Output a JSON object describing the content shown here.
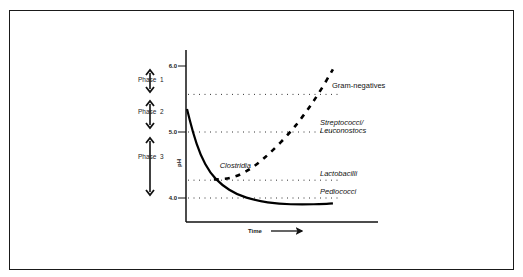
{
  "chart_data": {
    "type": "line",
    "title": "",
    "xlabel": "Time",
    "ylabel": "pH",
    "ylim": [
      3.8,
      6.2
    ],
    "xlim": [
      0,
      10
    ],
    "yticks": [
      {
        "value": 6.0,
        "label": "6.0"
      },
      {
        "value": 5.0,
        "label": "5.0"
      },
      {
        "value": 4.0,
        "label": "4.0"
      }
    ],
    "grid": false,
    "series": [
      {
        "name": "pH",
        "style": "solid",
        "points": [
          [
            0,
            5.35
          ],
          [
            0.3,
            5.0
          ],
          [
            0.7,
            4.65
          ],
          [
            1.2,
            4.38
          ],
          [
            1.8,
            4.2
          ],
          [
            2.6,
            4.05
          ],
          [
            3.6,
            3.96
          ],
          [
            4.8,
            3.91
          ],
          [
            6.0,
            3.9
          ],
          [
            7.2,
            3.91
          ],
          [
            7.6,
            3.92
          ]
        ]
      },
      {
        "name": "Bacterial growth (dashed)",
        "style": "dashed",
        "points": [
          [
            1.4,
            4.28
          ],
          [
            2.4,
            4.3
          ],
          [
            3.4,
            4.45
          ],
          [
            4.4,
            4.7
          ],
          [
            5.4,
            5.0
          ],
          [
            6.2,
            5.3
          ],
          [
            6.9,
            5.6
          ],
          [
            7.6,
            5.95
          ]
        ]
      }
    ],
    "thresholds": [
      {
        "name": "Gram-negatives",
        "value": 5.57,
        "label": "Gram-negatives",
        "italic": false
      },
      {
        "name": "Streptococci/Leuconostocs",
        "value": 5.0,
        "label_lines": [
          "Streptococci/",
          "Leuconostocs"
        ],
        "italic": true
      },
      {
        "name": "Lactobacilli",
        "value": 4.27,
        "label": "Lactobacilli",
        "italic": true
      },
      {
        "name": "Pediococci",
        "value": 4.0,
        "label": "Pediococci",
        "italic": true
      }
    ],
    "annotations": [
      {
        "text": "Clostridia",
        "x": 1.7,
        "y": 4.46,
        "italic": true
      }
    ],
    "phases": [
      {
        "label": "Phase 1",
        "from": 6.0,
        "to": 5.57
      },
      {
        "label": "Phase 2",
        "from": 5.57,
        "to": 5.0
      },
      {
        "label": "Phase 3",
        "from": 5.0,
        "to": 4.0
      }
    ],
    "x_arrow": true
  }
}
